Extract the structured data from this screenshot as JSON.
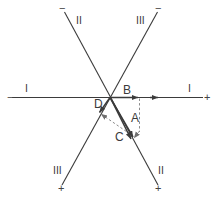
{
  "figure": {
    "type": "vector-diagram",
    "stroke_color": "#3b3b3b",
    "dash_color": "#8a8a8a",
    "background": "#ffffff",
    "origin_label": "D",
    "axes": [
      {
        "name": "axis-I",
        "label": "I",
        "negative_sign": "−",
        "positive_sign": "+",
        "left_label": "I",
        "right_label": "I"
      },
      {
        "name": "axis-II",
        "label": "II",
        "negative_sign": "−",
        "positive_sign": "+",
        "top_label": "II",
        "bottom_label": "II"
      },
      {
        "name": "axis-III",
        "label": "III",
        "negative_sign": "−",
        "positive_sign": "+",
        "top_label": "III",
        "bottom_label": "III"
      }
    ],
    "vectors": [
      {
        "name": "vector-A",
        "label": "A"
      },
      {
        "name": "vector-B",
        "label": "B"
      },
      {
        "name": "vector-C",
        "label": "C"
      }
    ],
    "labels": {
      "origin": "D",
      "vector_a": "A",
      "vector_b": "B",
      "vector_c": "C",
      "axis_i_left": "I",
      "axis_i_right": "I",
      "axis_ii_top": "II",
      "axis_ii_bottom": "II",
      "axis_iii_top": "III",
      "axis_iii_bottom": "III",
      "sign_i_left": "−",
      "sign_i_right": "+",
      "sign_ii_top": "−",
      "sign_ii_bottom": "+",
      "sign_iii_top": "−",
      "sign_iii_bottom": "+"
    }
  }
}
